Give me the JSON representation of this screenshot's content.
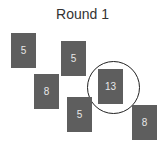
{
  "title": "Round 1",
  "cards": [
    {
      "value": "5",
      "x": 11,
      "y": 33
    },
    {
      "value": "5",
      "x": 61,
      "y": 41
    },
    {
      "value": "8",
      "x": 34,
      "y": 74
    },
    {
      "value": "13",
      "x": 98,
      "y": 69
    },
    {
      "value": "5",
      "x": 67,
      "y": 97
    },
    {
      "value": "8",
      "x": 132,
      "y": 105
    }
  ],
  "highlight": {
    "card_index": 3,
    "value": "13"
  },
  "colors": {
    "card": "#5e5e5e",
    "card_text": "#e8e8e8",
    "ring": "#222222"
  }
}
